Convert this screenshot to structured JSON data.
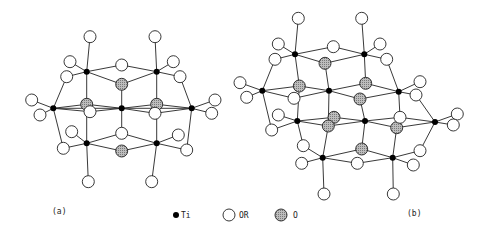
{
  "figure": {
    "panels": [
      {
        "id": "a",
        "label": "(a)",
        "ti": [
          [
            86.7,
            71.7
          ],
          [
            156.7,
            71.7
          ],
          [
            53.3,
            108.3
          ],
          [
            121.7,
            108.3
          ],
          [
            191.7,
            108.3
          ],
          [
            86.7,
            143.3
          ],
          [
            156.7,
            143.3
          ]
        ],
        "or": [
          [
            90,
            36.7
          ],
          [
            155,
            36.7
          ],
          [
            70,
            61.7
          ],
          [
            173.3,
            61.7
          ],
          [
            121.7,
            65
          ],
          [
            66.7,
            76.7
          ],
          [
            180,
            76.7
          ],
          [
            31.7,
            100
          ],
          [
            40,
            115
          ],
          [
            90,
            111.7
          ],
          [
            155,
            113.3
          ],
          [
            215,
            100
          ],
          [
            211.7,
            113.3
          ],
          [
            121.7,
            133.3
          ],
          [
            71.7,
            131.7
          ],
          [
            178.3,
            135
          ],
          [
            63.3,
            148.3
          ],
          [
            186.7,
            150
          ],
          [
            88.3,
            181.7
          ],
          [
            151.7,
            181.7
          ]
        ],
        "o": [
          [
            121.7,
            84.3
          ],
          [
            86.7,
            104.3
          ],
          [
            156.7,
            104.3
          ],
          [
            121.7,
            151
          ]
        ],
        "bonds": [
          [
            "ti",
            0,
            "or",
            0
          ],
          [
            "ti",
            0,
            "or",
            2
          ],
          [
            "ti",
            0,
            "or",
            4
          ],
          [
            "ti",
            0,
            "o",
            0
          ],
          [
            "ti",
            0,
            "or",
            5
          ],
          [
            "ti",
            0,
            "ti",
            5
          ],
          [
            "ti",
            1,
            "or",
            1
          ],
          [
            "ti",
            1,
            "or",
            3
          ],
          [
            "ti",
            1,
            "or",
            4
          ],
          [
            "ti",
            1,
            "o",
            0
          ],
          [
            "ti",
            1,
            "or",
            6
          ],
          [
            "ti",
            1,
            "ti",
            6
          ],
          [
            "ti",
            2,
            "or",
            7
          ],
          [
            "ti",
            2,
            "or",
            8
          ],
          [
            "ti",
            2,
            "or",
            5
          ],
          [
            "ti",
            2,
            "or",
            16
          ],
          [
            "ti",
            2,
            "o",
            1
          ],
          [
            "ti",
            2,
            "or",
            9
          ],
          [
            "ti",
            2,
            "ti",
            3
          ],
          [
            "ti",
            3,
            "o",
            0
          ],
          [
            "ti",
            3,
            "o",
            1
          ],
          [
            "ti",
            3,
            "o",
            2
          ],
          [
            "ti",
            3,
            "or",
            9
          ],
          [
            "ti",
            3,
            "or",
            10
          ],
          [
            "ti",
            3,
            "ti",
            4
          ],
          [
            "ti",
            3,
            "or",
            13
          ],
          [
            "ti",
            4,
            "or",
            11
          ],
          [
            "ti",
            4,
            "or",
            12
          ],
          [
            "ti",
            4,
            "or",
            6
          ],
          [
            "ti",
            4,
            "or",
            17
          ],
          [
            "ti",
            4,
            "o",
            2
          ],
          [
            "ti",
            4,
            "or",
            10
          ],
          [
            "ti",
            5,
            "or",
            14
          ],
          [
            "ti",
            5,
            "or",
            16
          ],
          [
            "ti",
            5,
            "or",
            13
          ],
          [
            "ti",
            5,
            "o",
            3
          ],
          [
            "ti",
            5,
            "or",
            18
          ],
          [
            "ti",
            6,
            "or",
            15
          ],
          [
            "ti",
            6,
            "or",
            17
          ],
          [
            "ti",
            6,
            "or",
            13
          ],
          [
            "ti",
            6,
            "o",
            3
          ],
          [
            "ti",
            6,
            "or",
            19
          ]
        ]
      },
      {
        "id": "b",
        "label": "(b)",
        "ti": [
          [
            295,
            54.3
          ],
          [
            364.3,
            54.3
          ],
          [
            262.3,
            90.7
          ],
          [
            329,
            90.7
          ],
          [
            398.7,
            91.7
          ],
          [
            297.3,
            121
          ],
          [
            365,
            121
          ],
          [
            435,
            122
          ],
          [
            322.7,
            157.7
          ],
          [
            392.7,
            157.7
          ]
        ],
        "or": [
          [
            298.3,
            18.3
          ],
          [
            361.7,
            18.3
          ],
          [
            278.3,
            44
          ],
          [
            333.3,
            46.7
          ],
          [
            380,
            44
          ],
          [
            275,
            59.3
          ],
          [
            386.7,
            59.3
          ],
          [
            240,
            82.7
          ],
          [
            246.7,
            97.3
          ],
          [
            294,
            98.3
          ],
          [
            420,
            81.7
          ],
          [
            416,
            95
          ],
          [
            278.3,
            115
          ],
          [
            271.7,
            130
          ],
          [
            400,
            117.3
          ],
          [
            457.3,
            114
          ],
          [
            453.3,
            125
          ],
          [
            303.3,
            145.7
          ],
          [
            420,
            150.7
          ],
          [
            301.7,
            163.3
          ],
          [
            357.3,
            163.3
          ],
          [
            413.3,
            165
          ],
          [
            324,
            194
          ],
          [
            393.3,
            194
          ]
        ],
        "o": [
          [
            325,
            63.3
          ],
          [
            299.3,
            86
          ],
          [
            365.7,
            83.3
          ],
          [
            360,
            99
          ],
          [
            334,
            117.3
          ],
          [
            328.3,
            126
          ],
          [
            396.7,
            127.7
          ],
          [
            361.7,
            149
          ]
        ],
        "bonds": [
          [
            "ti",
            0,
            "or",
            0
          ],
          [
            "ti",
            0,
            "or",
            2
          ],
          [
            "ti",
            0,
            "or",
            3
          ],
          [
            "ti",
            0,
            "o",
            0
          ],
          [
            "ti",
            0,
            "or",
            5
          ],
          [
            "ti",
            0,
            "o",
            1
          ],
          [
            "ti",
            1,
            "or",
            1
          ],
          [
            "ti",
            1,
            "or",
            4
          ],
          [
            "ti",
            1,
            "or",
            3
          ],
          [
            "ti",
            1,
            "o",
            0
          ],
          [
            "ti",
            1,
            "or",
            6
          ],
          [
            "ti",
            1,
            "o",
            2
          ],
          [
            "ti",
            2,
            "or",
            7
          ],
          [
            "ti",
            2,
            "or",
            8
          ],
          [
            "ti",
            2,
            "or",
            5
          ],
          [
            "ti",
            2,
            "or",
            13
          ],
          [
            "ti",
            2,
            "o",
            1
          ],
          [
            "ti",
            2,
            "or",
            9
          ],
          [
            "ti",
            3,
            "o",
            0
          ],
          [
            "ti",
            3,
            "o",
            1
          ],
          [
            "ti",
            3,
            "o",
            2
          ],
          [
            "ti",
            3,
            "o",
            3
          ],
          [
            "ti",
            3,
            "or",
            9
          ],
          [
            "ti",
            3,
            "o",
            5
          ],
          [
            "ti",
            4,
            "or",
            10
          ],
          [
            "ti",
            4,
            "or",
            11
          ],
          [
            "ti",
            4,
            "or",
            6
          ],
          [
            "ti",
            4,
            "o",
            2
          ],
          [
            "ti",
            4,
            "o",
            3
          ],
          [
            "ti",
            4,
            "or",
            14
          ],
          [
            "ti",
            5,
            "or",
            12
          ],
          [
            "ti",
            5,
            "or",
            13
          ],
          [
            "ti",
            5,
            "o",
            1
          ],
          [
            "ti",
            5,
            "o",
            4
          ],
          [
            "ti",
            5,
            "o",
            5
          ],
          [
            "ti",
            5,
            "or",
            17
          ],
          [
            "ti",
            6,
            "o",
            4
          ],
          [
            "ti",
            6,
            "o",
            5
          ],
          [
            "ti",
            6,
            "o",
            3
          ],
          [
            "ti",
            6,
            "or",
            14
          ],
          [
            "ti",
            6,
            "o",
            6
          ],
          [
            "ti",
            6,
            "o",
            7
          ],
          [
            "ti",
            7,
            "or",
            15
          ],
          [
            "ti",
            7,
            "or",
            16
          ],
          [
            "ti",
            7,
            "or",
            11
          ],
          [
            "ti",
            7,
            "or",
            18
          ],
          [
            "ti",
            7,
            "o",
            6
          ],
          [
            "ti",
            7,
            "or",
            14
          ],
          [
            "ti",
            8,
            "or",
            17
          ],
          [
            "ti",
            8,
            "or",
            19
          ],
          [
            "ti",
            8,
            "or",
            20
          ],
          [
            "ti",
            8,
            "o",
            5
          ],
          [
            "ti",
            8,
            "o",
            7
          ],
          [
            "ti",
            8,
            "or",
            22
          ],
          [
            "ti",
            9,
            "or",
            18
          ],
          [
            "ti",
            9,
            "or",
            21
          ],
          [
            "ti",
            9,
            "or",
            20
          ],
          [
            "ti",
            9,
            "o",
            6
          ],
          [
            "ti",
            9,
            "o",
            7
          ],
          [
            "ti",
            9,
            "or",
            23
          ]
        ]
      }
    ],
    "legend": [
      {
        "symbol": "ti",
        "label": "Ti"
      },
      {
        "symbol": "or",
        "label": "OR"
      },
      {
        "symbol": "o",
        "label": "O"
      }
    ],
    "colors": {
      "ti": "#000000",
      "or_fill": "#ffffff",
      "o_fill": "#a8a8a8",
      "stroke": "#222222"
    }
  }
}
